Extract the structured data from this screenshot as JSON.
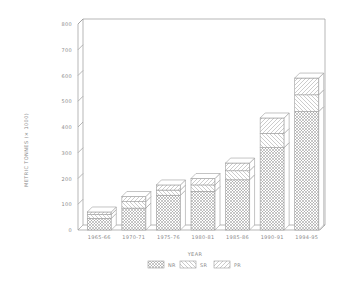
{
  "chart_data": {
    "type": "bar",
    "stacked": true,
    "style": "3d",
    "title": "",
    "xlabel": "YEAR",
    "ylabel": "METRIC TONNES (× 1000)",
    "ylim": [
      0,
      800
    ],
    "yticks": [
      0,
      100,
      200,
      300,
      400,
      500,
      600,
      700,
      800
    ],
    "grid": false,
    "legend_position": "bottom",
    "categories": [
      "1965-66",
      "1970-71",
      "1975-76",
      "1980-81",
      "1985-86",
      "1990-91",
      "1994-95"
    ],
    "series": [
      {
        "name": "NR",
        "pattern": "crosshatch",
        "values": [
          45,
          85,
          135,
          150,
          195,
          320,
          460
        ]
      },
      {
        "name": "SR",
        "pattern": "backslash-hatch",
        "values": [
          15,
          25,
          20,
          25,
          35,
          55,
          65
        ]
      },
      {
        "name": "PR",
        "pattern": "slash-hatch",
        "values": [
          10,
          20,
          20,
          25,
          30,
          60,
          65
        ]
      }
    ]
  },
  "colors": {
    "line": "#9a9a9a",
    "text": "#8a8a8a",
    "background": "#ffffff"
  }
}
